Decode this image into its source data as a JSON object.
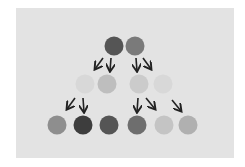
{
  "diagram": {
    "background": "#ffffff",
    "panel_color": "#e3e3e3",
    "arrow_color": "#222222",
    "nodes": [
      {
        "id": "r1a",
        "row": 1,
        "cx": 114,
        "cy": 46,
        "r": 9.5,
        "color": "#555555"
      },
      {
        "id": "r1b",
        "row": 1,
        "cx": 135,
        "cy": 46,
        "r": 9.5,
        "color": "#7a7a7a"
      },
      {
        "id": "r2a",
        "row": 2,
        "cx": 85,
        "cy": 84,
        "r": 9.5,
        "color": "#d8d8d8"
      },
      {
        "id": "r2b",
        "row": 2,
        "cx": 107,
        "cy": 84,
        "r": 9.5,
        "color": "#bebebe"
      },
      {
        "id": "r2c",
        "row": 2,
        "cx": 139,
        "cy": 84,
        "r": 9.5,
        "color": "#cbcbcb"
      },
      {
        "id": "r2d",
        "row": 2,
        "cx": 163,
        "cy": 84,
        "r": 9.5,
        "color": "#d8d8d8"
      },
      {
        "id": "r3a",
        "row": 3,
        "cx": 57,
        "cy": 125,
        "r": 9.5,
        "color": "#8e8e8e"
      },
      {
        "id": "r3b",
        "row": 3,
        "cx": 83,
        "cy": 125,
        "r": 9.5,
        "color": "#3d3d3d"
      },
      {
        "id": "r3c",
        "row": 3,
        "cx": 109,
        "cy": 125,
        "r": 9.5,
        "color": "#555555"
      },
      {
        "id": "r3d",
        "row": 3,
        "cx": 137,
        "cy": 125,
        "r": 9.5,
        "color": "#6e6e6e"
      },
      {
        "id": "r3e",
        "row": 3,
        "cx": 164,
        "cy": 125,
        "r": 9.5,
        "color": "#c4c4c4"
      },
      {
        "id": "r3f",
        "row": 3,
        "cx": 188,
        "cy": 125,
        "r": 9.5,
        "color": "#b0b0b0"
      }
    ],
    "arrows": [
      {
        "from": "r1a",
        "x1": 103,
        "y1": 58,
        "x2": 95,
        "y2": 69
      },
      {
        "from": "r1a",
        "x1": 111,
        "y1": 58,
        "x2": 110,
        "y2": 71
      },
      {
        "from": "r1b",
        "x1": 136,
        "y1": 58,
        "x2": 137,
        "y2": 71
      },
      {
        "from": "r1b",
        "x1": 143,
        "y1": 58,
        "x2": 151,
        "y2": 69
      },
      {
        "from": "r2a",
        "x1": 75,
        "y1": 98,
        "x2": 67,
        "y2": 109
      },
      {
        "from": "r2a",
        "x1": 83,
        "y1": 98,
        "x2": 84,
        "y2": 112
      },
      {
        "from": "r2c",
        "x1": 138,
        "y1": 98,
        "x2": 137,
        "y2": 112
      },
      {
        "from": "r2c",
        "x1": 146,
        "y1": 98,
        "x2": 155,
        "y2": 109
      },
      {
        "from": "r2d",
        "x1": 172,
        "y1": 100,
        "x2": 181,
        "y2": 111
      }
    ]
  }
}
